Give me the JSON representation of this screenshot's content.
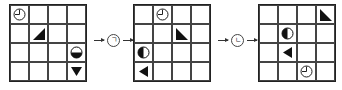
{
  "grids": [
    {
      "cells": [
        [
          "clock",
          "",
          "",
          ""
        ],
        [
          "",
          "tri-br",
          "",
          ""
        ],
        [
          "",
          "",
          "",
          "half-bottom"
        ],
        [
          "",
          "",
          "",
          "tri-down"
        ]
      ]
    },
    {
      "cells": [
        [
          "",
          "clock",
          "",
          ""
        ],
        [
          "",
          "",
          "tri-bl",
          ""
        ],
        [
          "half-left",
          "",
          "",
          ""
        ],
        [
          "tri-left",
          "",
          "",
          ""
        ]
      ]
    },
    {
      "cells": [
        [
          "",
          "",
          "",
          "tri-bl"
        ],
        [
          "",
          "half-left",
          "",
          ""
        ],
        [
          "",
          "tri-left",
          "",
          ""
        ],
        [
          "",
          "",
          "clock",
          ""
        ]
      ]
    }
  ],
  "operations": [
    {
      "symbol": "ㄱ"
    },
    {
      "symbol": "ㄴ"
    }
  ]
}
